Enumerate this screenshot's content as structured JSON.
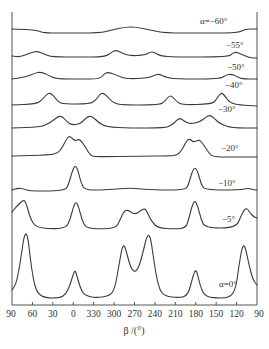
{
  "chart_data": {
    "type": "line",
    "title": "",
    "xlabel": "β /(°)",
    "ylabel": "",
    "x_ticks": [
      "90",
      "60",
      "30",
      "0",
      "330",
      "300",
      "270",
      "240",
      "210",
      "180",
      "150",
      "120",
      "90"
    ],
    "x_note": "β axis wraps: 90 → 0 → 330 ... 120 → 90 (decreasing, modulo 360)",
    "grid": false,
    "legend_position": "inline labels at right of each curve",
    "series": [
      {
        "name": "α=−60°",
        "label": "α=−60°",
        "label_pos": [
          200,
          24
        ],
        "points": [
          [
            12,
            29
          ],
          [
            36,
            30
          ],
          [
            44,
            33
          ],
          [
            60,
            33
          ],
          [
            100,
            33
          ],
          [
            112,
            30
          ],
          [
            125,
            27
          ],
          [
            136,
            27
          ],
          [
            150,
            30
          ],
          [
            165,
            33
          ],
          [
            200,
            33
          ],
          [
            238,
            33
          ],
          [
            245,
            29
          ],
          [
            257,
            29
          ]
        ]
      },
      {
        "name": "α=−55°",
        "label": "−55°",
        "label_pos": [
          226,
          48
        ],
        "points": [
          [
            12,
            56
          ],
          [
            20,
            57
          ],
          [
            30,
            53
          ],
          [
            37,
            51
          ],
          [
            44,
            54
          ],
          [
            52,
            57
          ],
          [
            80,
            57
          ],
          [
            105,
            57
          ],
          [
            112,
            52
          ],
          [
            116,
            50
          ],
          [
            122,
            53
          ],
          [
            130,
            56
          ],
          [
            145,
            55
          ],
          [
            150,
            52
          ],
          [
            154,
            52
          ],
          [
            160,
            56
          ],
          [
            175,
            57
          ],
          [
            228,
            57
          ],
          [
            233,
            53
          ],
          [
            236,
            52
          ],
          [
            241,
            54
          ],
          [
            250,
            58
          ],
          [
            257,
            58
          ]
        ]
      },
      {
        "name": "α=−50°",
        "label": "−50°",
        "label_pos": [
          227,
          70
        ],
        "points": [
          [
            12,
            79
          ],
          [
            26,
            77
          ],
          [
            35,
            73
          ],
          [
            41,
            72
          ],
          [
            48,
            75
          ],
          [
            56,
            79
          ],
          [
            80,
            79
          ],
          [
            100,
            79
          ],
          [
            104,
            74
          ],
          [
            108,
            72
          ],
          [
            116,
            75
          ],
          [
            126,
            79
          ],
          [
            148,
            78
          ],
          [
            155,
            75
          ],
          [
            159,
            74
          ],
          [
            165,
            77
          ],
          [
            175,
            79
          ],
          [
            220,
            79
          ],
          [
            226,
            75
          ],
          [
            231,
            74
          ],
          [
            236,
            76
          ],
          [
            242,
            79
          ],
          [
            257,
            79
          ]
        ]
      },
      {
        "name": "α=−40°",
        "label": "−40°",
        "label_pos": [
          225,
          88
        ],
        "points": [
          [
            12,
            105
          ],
          [
            36,
            104
          ],
          [
            42,
            100
          ],
          [
            47,
            94
          ],
          [
            50,
            93
          ],
          [
            54,
            96
          ],
          [
            58,
            102
          ],
          [
            64,
            104
          ],
          [
            90,
            104
          ],
          [
            96,
            100
          ],
          [
            100,
            94
          ],
          [
            103,
            93
          ],
          [
            107,
            96
          ],
          [
            112,
            102
          ],
          [
            120,
            105
          ],
          [
            160,
            105
          ],
          [
            165,
            101
          ],
          [
            169,
            96
          ],
          [
            172,
            96
          ],
          [
            176,
            101
          ],
          [
            182,
            105
          ],
          [
            212,
            104
          ],
          [
            216,
            100
          ],
          [
            220,
            94
          ],
          [
            222,
            93
          ],
          [
            225,
            96
          ],
          [
            230,
            103
          ],
          [
            240,
            105
          ],
          [
            257,
            106
          ]
        ]
      },
      {
        "name": "α=−30°",
        "label": "−30°",
        "label_pos": [
          218,
          112
        ],
        "points": [
          [
            12,
            128
          ],
          [
            40,
            127
          ],
          [
            48,
            124
          ],
          [
            55,
            119
          ],
          [
            59,
            116
          ],
          [
            63,
            117
          ],
          [
            67,
            122
          ],
          [
            72,
            125
          ],
          [
            80,
            124
          ],
          [
            85,
            119
          ],
          [
            89,
            116
          ],
          [
            93,
            117
          ],
          [
            98,
            122
          ],
          [
            106,
            127
          ],
          [
            130,
            128
          ],
          [
            165,
            128
          ],
          [
            172,
            125
          ],
          [
            177,
            120
          ],
          [
            180,
            118
          ],
          [
            184,
            121
          ],
          [
            190,
            124
          ],
          [
            200,
            122
          ],
          [
            206,
            117
          ],
          [
            210,
            115
          ],
          [
            214,
            118
          ],
          [
            220,
            124
          ],
          [
            232,
            128
          ],
          [
            257,
            128
          ]
        ]
      },
      {
        "name": "α=−20°",
        "label": "−20°",
        "label_pos": [
          221,
          151
        ],
        "points": [
          [
            12,
            156
          ],
          [
            50,
            155
          ],
          [
            58,
            153
          ],
          [
            62,
            148
          ],
          [
            66,
            140
          ],
          [
            69,
            136
          ],
          [
            72,
            138
          ],
          [
            75,
            141
          ],
          [
            79,
            139
          ],
          [
            82,
            142
          ],
          [
            86,
            148
          ],
          [
            90,
            155
          ],
          [
            95,
            157
          ],
          [
            140,
            156
          ],
          [
            170,
            156
          ],
          [
            178,
            155
          ],
          [
            183,
            148
          ],
          [
            187,
            140
          ],
          [
            190,
            139
          ],
          [
            193,
            142
          ],
          [
            196,
            141
          ],
          [
            200,
            140
          ],
          [
            203,
            144
          ],
          [
            207,
            150
          ],
          [
            212,
            157
          ],
          [
            230,
            157
          ],
          [
            257,
            157
          ]
        ]
      },
      {
        "name": "α=−10°",
        "label": "−10°",
        "label_pos": [
          218,
          186
        ],
        "points": [
          [
            12,
            190
          ],
          [
            18,
            188
          ],
          [
            24,
            189
          ],
          [
            30,
            191
          ],
          [
            50,
            191
          ],
          [
            66,
            190
          ],
          [
            69,
            183
          ],
          [
            72,
            172
          ],
          [
            75,
            165
          ],
          [
            78,
            170
          ],
          [
            81,
            183
          ],
          [
            85,
            190
          ],
          [
            100,
            190
          ],
          [
            118,
            189
          ],
          [
            130,
            188
          ],
          [
            140,
            189
          ],
          [
            160,
            190
          ],
          [
            186,
            190
          ],
          [
            189,
            183
          ],
          [
            192,
            172
          ],
          [
            195,
            167
          ],
          [
            198,
            172
          ],
          [
            201,
            184
          ],
          [
            205,
            190
          ],
          [
            240,
            190
          ],
          [
            248,
            188
          ],
          [
            254,
            190
          ],
          [
            257,
            190
          ]
        ]
      },
      {
        "name": "α=−5°",
        "label": "−5°",
        "label_pos": [
          222,
          222
        ],
        "points": [
          [
            12,
            212
          ],
          [
            17,
            206
          ],
          [
            21,
            202
          ],
          [
            24,
            200
          ],
          [
            26,
            203
          ],
          [
            28,
            210
          ],
          [
            31,
            220
          ],
          [
            36,
            227
          ],
          [
            50,
            229
          ],
          [
            66,
            228
          ],
          [
            70,
            220
          ],
          [
            73,
            208
          ],
          [
            76,
            201
          ],
          [
            79,
            208
          ],
          [
            82,
            220
          ],
          [
            86,
            228
          ],
          [
            100,
            229
          ],
          [
            116,
            228
          ],
          [
            120,
            220
          ],
          [
            124,
            211
          ],
          [
            128,
            210
          ],
          [
            132,
            213
          ],
          [
            136,
            214
          ],
          [
            140,
            211
          ],
          [
            145,
            208
          ],
          [
            148,
            214
          ],
          [
            152,
            222
          ],
          [
            158,
            228
          ],
          [
            175,
            229
          ],
          [
            186,
            228
          ],
          [
            189,
            218
          ],
          [
            192,
            206
          ],
          [
            195,
            200
          ],
          [
            198,
            207
          ],
          [
            201,
            219
          ],
          [
            205,
            228
          ],
          [
            236,
            228
          ],
          [
            241,
            216
          ],
          [
            244,
            210
          ],
          [
            247,
            208
          ],
          [
            250,
            213
          ],
          [
            254,
            217
          ],
          [
            257,
            218
          ]
        ]
      },
      {
        "name": "α=0°",
        "label": "α=0°",
        "label_pos": [
          219,
          287
        ],
        "points": [
          [
            12,
            290
          ],
          [
            16,
            284
          ],
          [
            19,
            270
          ],
          [
            22,
            250
          ],
          [
            24,
            237
          ],
          [
            26,
            233
          ],
          [
            28,
            238
          ],
          [
            30,
            256
          ],
          [
            33,
            278
          ],
          [
            37,
            293
          ],
          [
            45,
            298
          ],
          [
            60,
            298
          ],
          [
            66,
            294
          ],
          [
            70,
            285
          ],
          [
            73,
            275
          ],
          [
            75,
            270
          ],
          [
            77,
            276
          ],
          [
            80,
            287
          ],
          [
            84,
            295
          ],
          [
            95,
            298
          ],
          [
            110,
            296
          ],
          [
            115,
            288
          ],
          [
            119,
            265
          ],
          [
            122,
            248
          ],
          [
            124,
            245
          ],
          [
            126,
            250
          ],
          [
            129,
            262
          ],
          [
            132,
            270
          ],
          [
            136,
            272
          ],
          [
            140,
            264
          ],
          [
            144,
            248
          ],
          [
            147,
            236
          ],
          [
            149,
            235
          ],
          [
            151,
            240
          ],
          [
            154,
            262
          ],
          [
            158,
            285
          ],
          [
            163,
            296
          ],
          [
            180,
            298
          ],
          [
            188,
            295
          ],
          [
            192,
            280
          ],
          [
            195,
            270
          ],
          [
            197,
            272
          ],
          [
            200,
            285
          ],
          [
            204,
            295
          ],
          [
            212,
            298
          ],
          [
            230,
            298
          ],
          [
            236,
            288
          ],
          [
            239,
            265
          ],
          [
            242,
            248
          ],
          [
            244,
            245
          ],
          [
            246,
            250
          ],
          [
            249,
            265
          ],
          [
            253,
            280
          ],
          [
            257,
            285
          ]
        ]
      }
    ]
  },
  "axis": {
    "xlabel": "β /(°)",
    "ticks": [
      "90",
      "60",
      "30",
      "0",
      "330",
      "300",
      "270",
      "240",
      "210",
      "180",
      "150",
      "120",
      "90"
    ]
  },
  "labels": {
    "a60": "α=−60°",
    "a55": "−55°",
    "a50": "−50°",
    "a40": "−40°",
    "a30": "−30°",
    "a20": "−20°",
    "a10": "−10°",
    "a5": "−5°",
    "a0": "α=0°"
  }
}
